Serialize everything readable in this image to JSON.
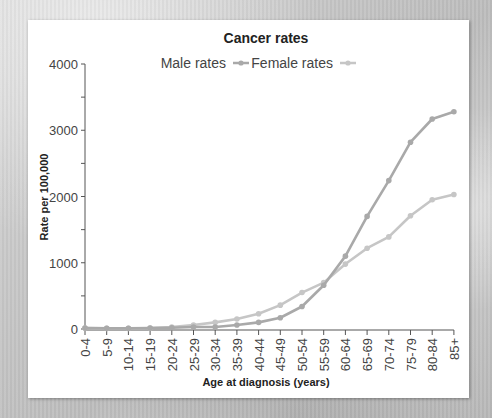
{
  "chart_data": {
    "type": "line",
    "title": "Cancer rates",
    "xlabel": "Age at diagnosis (years)",
    "ylabel": "Rate per 100,000",
    "ylim": [
      0,
      4000
    ],
    "yticks": [
      0,
      1000,
      2000,
      3000,
      4000
    ],
    "y_minor_step": 500,
    "grid": false,
    "legend_position": "top",
    "categories": [
      "0-4",
      "5-9",
      "10-14",
      "15-19",
      "20-24",
      "25-29",
      "30-34",
      "35-39",
      "40-44",
      "45-49",
      "50-54",
      "55-59",
      "60-64",
      "65-69",
      "70-74",
      "75-79",
      "80-84",
      "85+"
    ],
    "series": [
      {
        "name": "Male rates",
        "color": "#a9a9a9",
        "values": [
          15,
          10,
          10,
          15,
          20,
          30,
          30,
          60,
          100,
          170,
          340,
          660,
          1100,
          1700,
          2240,
          2820,
          3170,
          3280
        ]
      },
      {
        "name": "Female rates",
        "color": "#c6c6c6",
        "values": [
          15,
          10,
          10,
          15,
          30,
          60,
          100,
          150,
          230,
          360,
          550,
          700,
          980,
          1220,
          1390,
          1710,
          1950,
          2030
        ]
      }
    ]
  }
}
